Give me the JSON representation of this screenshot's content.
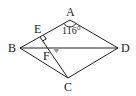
{
  "diagram": {
    "type": "geometry",
    "shape": "rhombus ABCD",
    "points": {
      "A": {
        "label": "A",
        "x": 70,
        "y": 20
      },
      "B": {
        "label": "B",
        "x": 20,
        "y": 48
      },
      "C": {
        "label": "C",
        "x": 68,
        "y": 78
      },
      "D": {
        "label": "D",
        "x": 118,
        "y": 48
      },
      "E": {
        "label": "E",
        "x": 40,
        "y": 37
      },
      "F": {
        "label": "F",
        "x": 53,
        "y": 48
      }
    },
    "segments": [
      "AB",
      "AD",
      "BC",
      "CD",
      "BD",
      "CE"
    ],
    "angle_label": "116°",
    "right_angle_at": "E",
    "shaded_angle_at": "F",
    "colors": {
      "stroke": "#222222",
      "shade": "#999999"
    }
  }
}
